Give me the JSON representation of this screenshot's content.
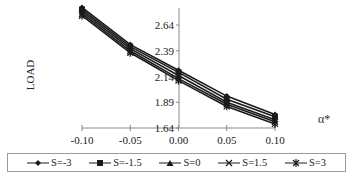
{
  "chart_data": {
    "type": "line",
    "title": "",
    "xlabel": "α*",
    "ylabel": "LOAD",
    "x": [
      -0.1,
      -0.05,
      0.0,
      0.05,
      0.1
    ],
    "x_tick_labels": [
      "-0.10",
      "-0.05",
      "0.00",
      "0.05",
      "0.10"
    ],
    "y_tick_labels": [
      "1.64",
      "1.89",
      "2.14",
      "2.39",
      "2.64"
    ],
    "y_ticks": [
      1.64,
      1.89,
      2.14,
      2.39,
      2.64
    ],
    "ylim": [
      1.64,
      2.89
    ],
    "xlim": [
      -0.1,
      0.1
    ],
    "grid": false,
    "legend_position": "bottom",
    "series": [
      {
        "name": "S=-3",
        "marker": "diamond",
        "values": [
          2.81,
          2.45,
          2.2,
          1.95,
          1.77
        ]
      },
      {
        "name": "S=-1.5",
        "marker": "square",
        "values": [
          2.79,
          2.43,
          2.18,
          1.92,
          1.75
        ]
      },
      {
        "name": "S=0",
        "marker": "triangle",
        "values": [
          2.77,
          2.41,
          2.15,
          1.89,
          1.72
        ]
      },
      {
        "name": "S=1.5",
        "marker": "x",
        "values": [
          2.75,
          2.39,
          2.12,
          1.87,
          1.7
        ]
      },
      {
        "name": "S=3",
        "marker": "star",
        "values": [
          2.73,
          2.37,
          2.1,
          1.85,
          1.68
        ]
      }
    ]
  },
  "legend": {
    "items": [
      {
        "label": "S=-3",
        "marker": "diamond"
      },
      {
        "label": "S=-1.5",
        "marker": "square"
      },
      {
        "label": "S=0",
        "marker": "triangle"
      },
      {
        "label": "S=1.5",
        "marker": "x"
      },
      {
        "label": "S=3",
        "marker": "star"
      }
    ]
  },
  "colors": {
    "line": "#1a1a1a",
    "axis": "#8a8a8a",
    "text": "#222222"
  }
}
